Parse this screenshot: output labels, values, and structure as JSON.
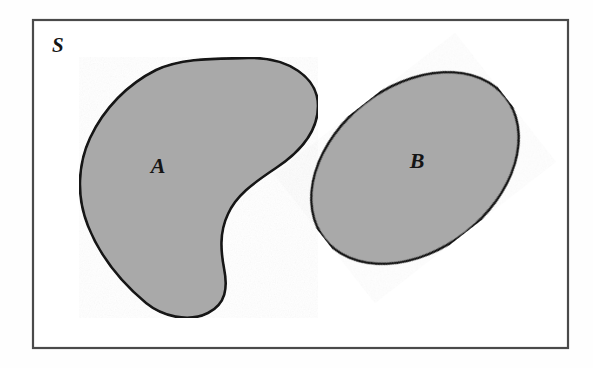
{
  "diagram": {
    "type": "set-diagram",
    "universe": {
      "label": "S",
      "label_x": 52,
      "label_y": 52,
      "frame": {
        "x": 33,
        "y": 20,
        "width": 535,
        "height": 328,
        "stroke": "#4a4a4a",
        "fill": "#ffffff",
        "stroke_width": 2.2
      }
    },
    "regions": [
      {
        "name": "A",
        "label": "A",
        "label_x": 158,
        "label_y": 173,
        "shape": "kidney",
        "fill": "#a9a9a9",
        "stroke": "#151515",
        "stroke_width": 2.6,
        "path": "M 248 58 C 288 57 318 77 318 106 C 318 132 300 152 276 168 C 252 184 236 196 228 214 C 219 233 221 252 224 268 C 228 288 226 304 208 313 C 188 323 162 316 146 303 C 122 283 100 256 88 226 C 76 196 78 164 90 138 C 104 108 128 84 156 70 C 184 57 220 59 248 58 Z"
      },
      {
        "name": "B",
        "label": "B",
        "label_x": 417,
        "label_y": 168,
        "shape": "ellipse",
        "fill": "#a9a9a9",
        "stroke": "#151515",
        "stroke_width": 2.6,
        "center_x": 415,
        "center_y": 168,
        "radius_x": 115,
        "radius_y": 82,
        "rotation_deg": -38
      }
    ],
    "colors": {
      "shaded_fill": "#a9a9a9",
      "outline": "#151515",
      "frame_stroke": "#4a4a4a",
      "background": "#ffffff",
      "label_color": "#151515"
    }
  }
}
